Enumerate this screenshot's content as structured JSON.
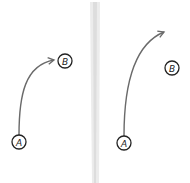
{
  "panels": [
    {
      "name": "left",
      "nodes": [
        {
          "id": "A",
          "label": "A",
          "cx": 19,
          "cy": 142
        },
        {
          "id": "B",
          "label": "B",
          "cx": 65,
          "cy": 61
        }
      ],
      "arrow": {
        "from": "A",
        "to": "B",
        "reaches_target": true
      }
    },
    {
      "name": "right",
      "nodes": [
        {
          "id": "A",
          "label": "A",
          "cx": 124,
          "cy": 143
        },
        {
          "id": "B",
          "label": "B",
          "cx": 172,
          "cy": 68
        }
      ],
      "arrow": {
        "from": "A",
        "to": "B",
        "reaches_target": false
      }
    }
  ],
  "colors": {
    "stroke": "#222222",
    "arrow": "#6a6a6a",
    "divider": "#e4e4e4"
  }
}
